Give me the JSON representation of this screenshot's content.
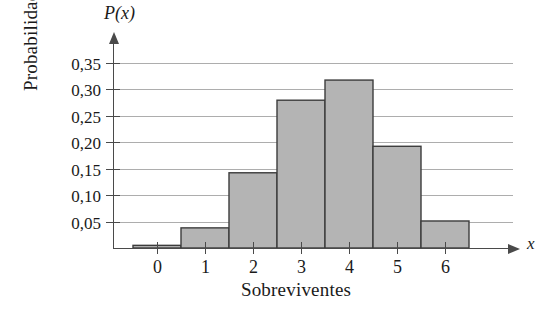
{
  "chart_data": {
    "type": "bar",
    "title": "",
    "xlabel": "Sobreviventes",
    "ylabel": "Probabilidade",
    "value_axis_symbol": "P(x)",
    "category_axis_symbol": "x",
    "categories": [
      "0",
      "1",
      "2",
      "3",
      "4",
      "5",
      "6"
    ],
    "values": [
      0.005,
      0.038,
      0.142,
      0.279,
      0.317,
      0.192,
      0.051
    ],
    "ylim": [
      0,
      0.37
    ],
    "xlim": [
      -0.5,
      6.5
    ],
    "ytick_labels": [
      "0,05",
      "0,10",
      "0,15",
      "0,20",
      "0,25",
      "0,30",
      "0,35"
    ],
    "ytick_values": [
      0.05,
      0.1,
      0.15,
      0.2,
      0.25,
      0.3,
      0.35
    ],
    "grid": true,
    "grid_axis": "y",
    "legend": false,
    "legend_position": "none",
    "bar_fill_color": "#b4b4b4",
    "bar_edge_color": "#3c3c3c",
    "gridline_color": "#adadad",
    "axis_color": "#4a4a4a",
    "decimal_separator": ",",
    "bar_width_fraction": 1.0
  }
}
